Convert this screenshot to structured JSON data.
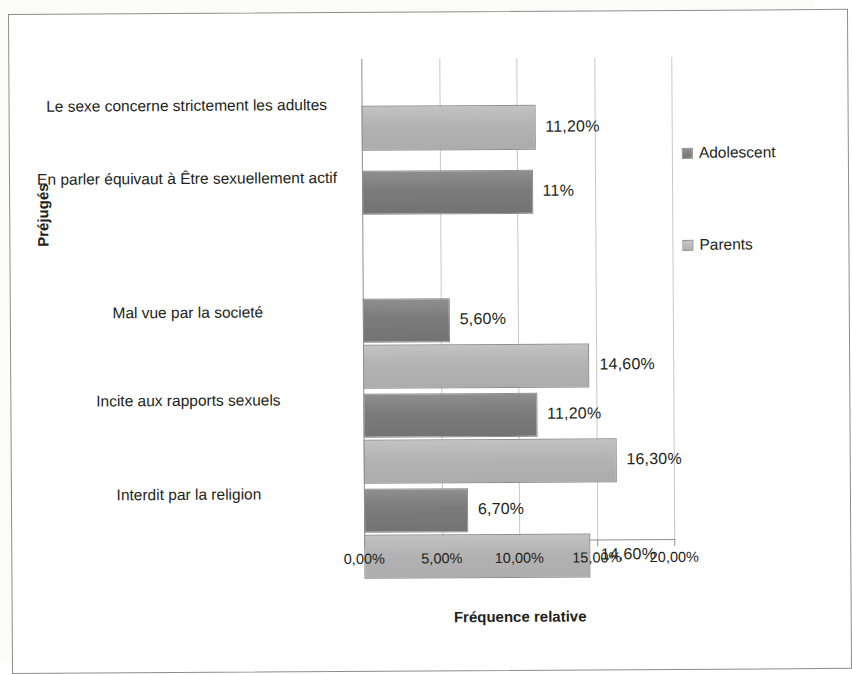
{
  "chart_data": {
    "type": "bar",
    "orientation": "horizontal",
    "title": "",
    "xlabel": "Fréquence relative",
    "ylabel": "Préjugés",
    "xlim": [
      0,
      20
    ],
    "xticks": [
      "0,00%",
      "5,00%",
      "10,00%",
      "15,00%",
      "20,00%"
    ],
    "xtick_values": [
      0,
      5,
      10,
      15,
      20
    ],
    "grid": true,
    "legend_position": "right",
    "categories": [
      "Le sexe concerne strictement les adultes",
      "En parler équivaut à Être sexuellement actif",
      "Mal vue par la societé",
      "Incite aux rapports sexuels",
      "Interdit par la religion"
    ],
    "series": [
      {
        "name": "Adolescent",
        "color": "#7b7b7b",
        "values": [
          null,
          11,
          5.6,
          11.2,
          6.7
        ],
        "labels": [
          "",
          "11%",
          "5,60%",
          "11,20%",
          "6,70%"
        ]
      },
      {
        "name": "Parents",
        "color": "#b3b3b3",
        "values": [
          11.2,
          null,
          14.6,
          16.3,
          14.6
        ],
        "labels": [
          "11,20%",
          "",
          "14,60%",
          "16,30%",
          "14,60%"
        ]
      }
    ]
  },
  "legend": {
    "entries": [
      {
        "label": "Adolescent",
        "swatch": "adolescent"
      },
      {
        "label": "Parents",
        "swatch": "parents"
      }
    ]
  },
  "axes": {
    "x_title": "Fréquence relative",
    "y_title": "Préjugés",
    "tick_labels": [
      "0,00%",
      "5,00%",
      "10,00%",
      "15,00%",
      "20,00%"
    ]
  },
  "bars": [
    {
      "series": "Parents",
      "category": "Le sexe concerne strictement les adultes",
      "value": 11.2,
      "label": "11,20%",
      "top": 47,
      "height": 45
    },
    {
      "series": "Adolescent",
      "category": "En parler équivaut à Être sexuellement actif",
      "value": 11,
      "label": "11%",
      "top": 112,
      "height": 44
    },
    {
      "series": "Adolescent",
      "category": "Mal vue par la societé",
      "value": 5.6,
      "label": "5,60%",
      "top": 240,
      "height": 44
    },
    {
      "series": "Parents",
      "category": "Mal vue par la societé",
      "value": 14.6,
      "label": "14,60%",
      "top": 286,
      "height": 44
    },
    {
      "series": "Adolescent",
      "category": "Incite aux rapports sexuels",
      "value": 11.2,
      "label": "11,20%",
      "top": 335,
      "height": 44
    },
    {
      "series": "Parents",
      "category": "Incite aux rapports sexuels",
      "value": 16.3,
      "label": "16,30%",
      "top": 381,
      "height": 44
    },
    {
      "series": "Adolescent",
      "category": "Interdit par la religion",
      "value": 6.7,
      "label": "6,70%",
      "top": 430,
      "height": 44
    },
    {
      "series": "Parents",
      "category": "Interdit par la religion",
      "value": 14.6,
      "label": "14,60%",
      "top": 476,
      "height": 44
    }
  ],
  "category_positions": [
    {
      "label": "Le sexe concerne strictement les adultes",
      "top": 35
    },
    {
      "label": "En parler équivaut à Être sexuellement actif",
      "top": 108
    },
    {
      "label": "Mal vue par la societé",
      "top": 242
    },
    {
      "label": "Incite aux rapports sexuels",
      "top": 330
    },
    {
      "label": "Interdit par la religion",
      "top": 424
    }
  ]
}
